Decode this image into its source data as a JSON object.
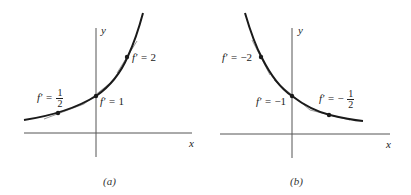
{
  "panels": [
    {
      "id": "a",
      "caption": "(a)",
      "axis_x": "x",
      "axis_y": "y",
      "curve": "increasing exponential",
      "points": [
        {
          "label_prefix": "f′ =",
          "value": "",
          "frac_num": "1",
          "frac_den": "2"
        },
        {
          "label_prefix": "f′ =",
          "value": "1"
        },
        {
          "label_prefix": "f′ =",
          "value": "2"
        }
      ]
    },
    {
      "id": "b",
      "caption": "(b)",
      "axis_x": "x",
      "axis_y": "y",
      "curve": "decreasing exponential",
      "points": [
        {
          "label_prefix": "f′ =",
          "value": "−2"
        },
        {
          "label_prefix": "f′ =",
          "value": "−1"
        },
        {
          "label_prefix": "f′ =",
          "value": "−",
          "frac_num": "1",
          "frac_den": "2"
        }
      ]
    }
  ],
  "colors": {
    "curve": "#1a1a1a",
    "axis": "#555555",
    "tangent": "#999999"
  }
}
